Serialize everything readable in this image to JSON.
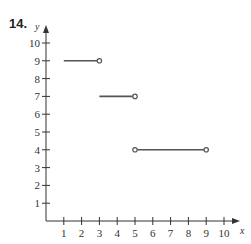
{
  "problem_number": "14.",
  "chart_data": {
    "type": "line",
    "title": "",
    "xlabel": "x",
    "ylabel": "y",
    "xlim": [
      0,
      10.7
    ],
    "ylim": [
      0,
      10.7
    ],
    "x_ticks": [
      1,
      2,
      3,
      4,
      5,
      6,
      7,
      8,
      9,
      10
    ],
    "y_ticks": [
      1,
      2,
      3,
      4,
      5,
      6,
      7,
      8,
      9,
      10
    ],
    "grid": false,
    "legend": null,
    "series": [
      {
        "name": "segment-1",
        "x": [
          1,
          3
        ],
        "y": [
          9,
          9
        ],
        "left_endpoint": "none",
        "right_endpoint": "open"
      },
      {
        "name": "segment-2",
        "x": [
          3,
          5
        ],
        "y": [
          7,
          7
        ],
        "left_endpoint": "none",
        "right_endpoint": "open"
      },
      {
        "name": "segment-3",
        "x": [
          5,
          9
        ],
        "y": [
          4,
          4
        ],
        "left_endpoint": "open",
        "right_endpoint": "open"
      }
    ],
    "colors": {
      "axis": "#333333",
      "line": "#555555"
    }
  }
}
